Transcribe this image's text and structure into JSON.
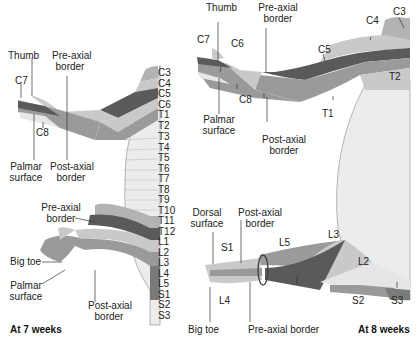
{
  "colors": {
    "light": "#c9c9c9",
    "mid": "#9a9a9a",
    "dark": "#5a5a5a",
    "pale": "#e6e6e6",
    "trunk": "#ececec",
    "band2": "#b3b3b3"
  },
  "left": {
    "caption": "At 7 weeks",
    "segments": [
      "C3",
      "C4",
      "C5",
      "C6",
      "T1",
      "T2",
      "T3",
      "T4",
      "T5",
      "T6",
      "T7",
      "T8",
      "T9",
      "T10",
      "T11",
      "T12",
      "L1",
      "L2",
      "L3",
      "L4",
      "L5",
      "S1",
      "S2",
      "S3"
    ],
    "upper_labels": {
      "thumb": "Thumb",
      "c7": "C7",
      "pre_axial_1": "Pre-axial",
      "pre_axial_2": "border",
      "c8": "C8",
      "palmar_1": "Palmar",
      "palmar_2": "surface",
      "post_axial_1": "Post-axial",
      "post_axial_2": "border"
    },
    "lower_labels": {
      "pre_axial_1": "Pre-axial",
      "pre_axial_2": "border",
      "big_toe": "Big toe",
      "palmar_1": "Palmar",
      "palmar_2": "surface",
      "post_axial_1": "Post-axial",
      "post_axial_2": "border"
    }
  },
  "right": {
    "caption": "At 8 weeks",
    "upper_labels": {
      "thumb": "Thumb",
      "pre_axial_1": "Pre-axial",
      "pre_axial_2": "border",
      "c7": "C7",
      "c6": "C6",
      "c5": "C5",
      "c4": "C4",
      "c3": "C3",
      "t2": "T2",
      "c8": "C8",
      "t1": "T1",
      "palmar_1": "Palmar",
      "palmar_2": "surface",
      "post_axial_1": "Post-axial",
      "post_axial_2": "border"
    },
    "lower_labels": {
      "dorsal_1": "Dorsal",
      "dorsal_2": "surface",
      "post_axial_1": "Post-axial",
      "post_axial_2": "border",
      "s1": "S1",
      "l5": "L5",
      "l3": "L3",
      "l2": "L2",
      "l4": "L4",
      "s2": "S2",
      "s3": "S3",
      "big_toe": "Big toe",
      "pre_axial": "Pre-axial border"
    }
  }
}
